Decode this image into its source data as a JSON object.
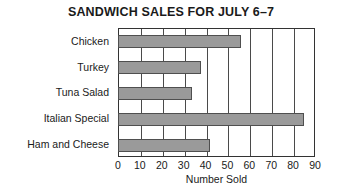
{
  "chart_data": {
    "type": "bar",
    "orientation": "horizontal",
    "title": "SANDWICH SALES FOR JULY 6–7",
    "categories": [
      "Chicken",
      "Turkey",
      "Tuna Salad",
      "Italian Special",
      "Ham and Cheese"
    ],
    "values": [
      56,
      38,
      34,
      85,
      42
    ],
    "xlabel": "Number Sold",
    "ylabel": "",
    "xlim": [
      0,
      90
    ],
    "xticks": [
      0,
      10,
      20,
      30,
      40,
      50,
      60,
      70,
      80,
      90
    ],
    "xtick_labels": [
      "0",
      "10",
      "20",
      "30",
      "40",
      "50",
      "60",
      "70",
      "80",
      "90"
    ],
    "grid": "vertical",
    "legend": "none",
    "bar_color": "#9a9a9a",
    "bar_edge_color": "#4f4f4f",
    "frame_color": "#333333",
    "background_color": "#ffffff"
  }
}
